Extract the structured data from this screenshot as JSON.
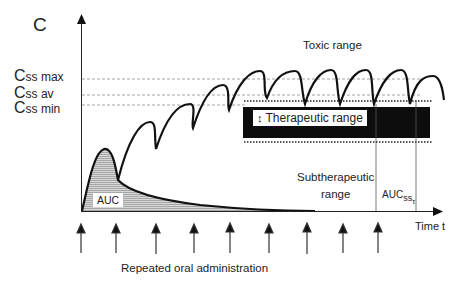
{
  "diagram": {
    "type": "pharmacokinetic concentration-time curve",
    "y_axis_label": "C",
    "x_axis_label": "Time t",
    "levels": [
      {
        "main": "C",
        "sub": "ss max"
      },
      {
        "main": "C",
        "sub": "ss av"
      },
      {
        "main": "C",
        "sub": "ss min"
      }
    ],
    "regions": {
      "toxic": "Toxic range",
      "therapeutic": "Therapeutic range",
      "therapeutic_arrow": "↕",
      "subtherapeutic_line1": "Subtherapeutic",
      "subtherapeutic_line2": "range"
    },
    "auc_label": "AUC",
    "auc_ss": {
      "main": "AUC",
      "sub": "ss",
      "subsub": "τ"
    },
    "dosing_label": "Repeated oral administration",
    "dose_arrow_count": 9,
    "colors": {
      "curve": "#111111",
      "therapeutic_band": "#0d0d0d",
      "auc_fill": "#bdbdbd",
      "guide_lines": "#888888"
    }
  }
}
